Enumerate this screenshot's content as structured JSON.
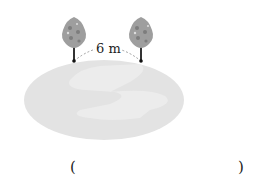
{
  "figure": {
    "distance_label": "6 m",
    "answer_open": "(",
    "answer_close": ")",
    "colors": {
      "ground": "#e2e2e2",
      "ground_highlight": "#ececec",
      "tree_crown": "#9e9e9e",
      "tree_spots": "#808080",
      "trunk": "#333333"
    }
  }
}
